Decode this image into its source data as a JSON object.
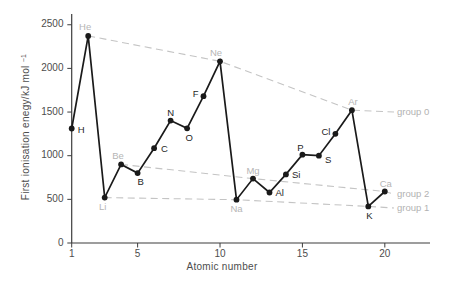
{
  "figure": {
    "width": 458,
    "height": 286,
    "background": "#ffffff"
  },
  "chart_data": {
    "type": "line",
    "title": "",
    "xlabel": "Atomic number",
    "ylabel": "First ionisation enegy/kJ mol⁻¹",
    "ylabel_main": "First ionisation enegy/kJ mol",
    "ylabel_sup": "−1",
    "xlim": [
      1,
      22.7
    ],
    "ylim": [
      0,
      2500
    ],
    "x_ticks": [
      1,
      5,
      10,
      15,
      20
    ],
    "y_ticks": [
      0,
      500,
      1000,
      1500,
      2000,
      2500
    ],
    "grid": false,
    "legend": "none",
    "colors": {
      "line": "#1a1a1a",
      "marker": "#1a1a1a",
      "axis": "#3d3d3d",
      "tick_label": "#4d4d4d",
      "element_label_dark": "#262626",
      "element_label_gray": "#b5b5b5",
      "group_line": "#c4c4c4",
      "group_label": "#b2b2b2"
    },
    "series": [
      {
        "name": "first ionisation energy",
        "points": [
          {
            "z": 1,
            "symbol": "H",
            "value": 1312,
            "label_color": "dark",
            "anchor": "start",
            "dx": 6,
            "dy": 4
          },
          {
            "z": 2,
            "symbol": "He",
            "value": 2372,
            "label_color": "gray",
            "anchor": "middle",
            "dx": -3,
            "dy": -6
          },
          {
            "z": 3,
            "symbol": "Li",
            "value": 520,
            "label_color": "gray",
            "anchor": "middle",
            "dx": -2,
            "dy": 12
          },
          {
            "z": 4,
            "symbol": "Be",
            "value": 900,
            "label_color": "gray",
            "anchor": "middle",
            "dx": -3,
            "dy": -5
          },
          {
            "z": 5,
            "symbol": "B",
            "value": 801,
            "label_color": "dark",
            "anchor": "middle",
            "dx": 3,
            "dy": 12
          },
          {
            "z": 6,
            "symbol": "C",
            "value": 1086,
            "label_color": "dark",
            "anchor": "start",
            "dx": 7,
            "dy": 4
          },
          {
            "z": 7,
            "symbol": "N",
            "value": 1402,
            "label_color": "dark",
            "anchor": "middle",
            "dx": 0,
            "dy": -5
          },
          {
            "z": 8,
            "symbol": "O",
            "value": 1314,
            "label_color": "dark",
            "anchor": "middle",
            "dx": 2,
            "dy": 13
          },
          {
            "z": 9,
            "symbol": "F",
            "value": 1681,
            "label_color": "dark",
            "anchor": "end",
            "dx": -5,
            "dy": 1
          },
          {
            "z": 10,
            "symbol": "Ne",
            "value": 2081,
            "label_color": "gray",
            "anchor": "middle",
            "dx": -4,
            "dy": -5
          },
          {
            "z": 11,
            "symbol": "Na",
            "value": 496,
            "label_color": "gray",
            "anchor": "middle",
            "dx": 0,
            "dy": 12
          },
          {
            "z": 12,
            "symbol": "Mg",
            "value": 738,
            "label_color": "gray",
            "anchor": "middle",
            "dx": 0,
            "dy": -5
          },
          {
            "z": 13,
            "symbol": "Al",
            "value": 578,
            "label_color": "dark",
            "anchor": "start",
            "dx": 6,
            "dy": 3
          },
          {
            "z": 14,
            "symbol": "Si",
            "value": 786,
            "label_color": "dark",
            "anchor": "start",
            "dx": 6,
            "dy": 4
          },
          {
            "z": 15,
            "symbol": "P",
            "value": 1012,
            "label_color": "dark",
            "anchor": "middle",
            "dx": -2,
            "dy": -4
          },
          {
            "z": 16,
            "symbol": "S",
            "value": 1000,
            "label_color": "dark",
            "anchor": "start",
            "dx": 6,
            "dy": 7
          },
          {
            "z": 17,
            "symbol": "Cl",
            "value": 1251,
            "label_color": "dark",
            "anchor": "end",
            "dx": -5,
            "dy": 1
          },
          {
            "z": 18,
            "symbol": "Ar",
            "value": 1521,
            "label_color": "gray",
            "anchor": "middle",
            "dx": 1,
            "dy": -5
          },
          {
            "z": 19,
            "symbol": "K",
            "value": 419,
            "label_color": "dark",
            "anchor": "middle",
            "dx": 1,
            "dy": 13
          },
          {
            "z": 20,
            "symbol": "Ca",
            "value": 590,
            "label_color": "gray",
            "anchor": "middle",
            "dx": 1,
            "dy": -5
          }
        ]
      }
    ],
    "group_lines": [
      {
        "name": "group 0",
        "members": [
          2,
          10,
          18
        ],
        "label_x": 397,
        "label_y": 115,
        "extend_x": 394
      },
      {
        "name": "group 2",
        "members": [
          4,
          12,
          20
        ],
        "label_x": 397,
        "label_y": 197,
        "extend_x": 394
      },
      {
        "name": "group 1",
        "members": [
          3,
          11,
          19
        ],
        "label_x": 397,
        "label_y": 211,
        "extend_x": 394
      }
    ]
  }
}
